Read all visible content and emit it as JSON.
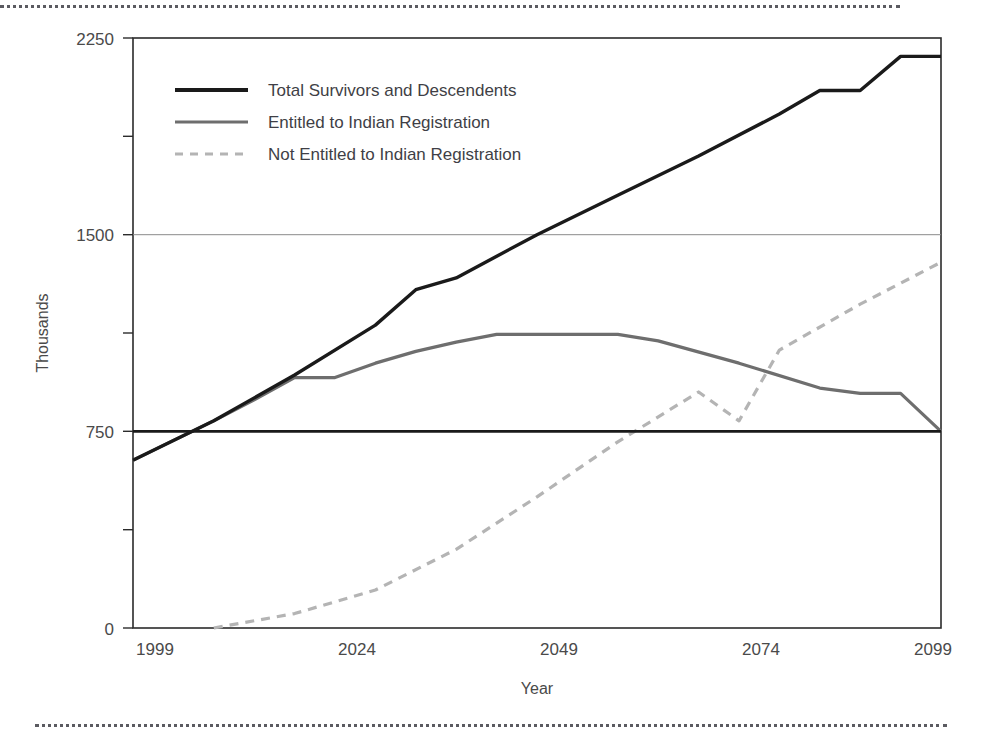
{
  "chart_data": {
    "type": "line",
    "title": "",
    "xlabel": "Year",
    "ylabel": "Thousands",
    "xlim": [
      1999,
      2099
    ],
    "ylim": [
      0,
      2250
    ],
    "xticks": [
      1999,
      2024,
      2049,
      2074,
      2099
    ],
    "xtick_labels": [
      "1999",
      "2024",
      "2049",
      "2074",
      "2099"
    ],
    "yticks": [
      0,
      375,
      750,
      1125,
      1500,
      1875,
      2250
    ],
    "ytick_labels": [
      "0",
      "",
      "750",
      "",
      "1500",
      "",
      "2250"
    ],
    "ytick_major": [
      0,
      750,
      1500,
      2250
    ],
    "ytick_minor": [
      375,
      1125,
      1875
    ],
    "grid": "horizontal-at-1500",
    "reference_line": {
      "label": "",
      "value": 750,
      "color": "#1a1a1a",
      "from": 1999,
      "to": 2099
    },
    "legend_position": "top-left-inside",
    "series": [
      {
        "name": "Total Survivors and Descendents",
        "style": "solid",
        "color": "#1a1a1a",
        "width": "thick",
        "x": [
          1999,
          2009,
          2019,
          2029,
          2034,
          2039,
          2049,
          2059,
          2069,
          2079,
          2084,
          2089,
          2094,
          2099
        ],
        "values": [
          640,
          790,
          965,
          1155,
          1290,
          1335,
          1500,
          1650,
          1800,
          1960,
          2050,
          2050,
          2180,
          2180
        ]
      },
      {
        "name": "Entitled to Indian Registration",
        "style": "solid",
        "color": "#6e6e6e",
        "width": "medium",
        "x": [
          1999,
          2009,
          2014,
          2019,
          2024,
          2029,
          2034,
          2039,
          2044,
          2049,
          2059,
          2064,
          2074,
          2084,
          2089,
          2094,
          2099
        ],
        "values": [
          640,
          790,
          870,
          955,
          955,
          1010,
          1055,
          1090,
          1120,
          1120,
          1120,
          1095,
          1010,
          915,
          895,
          895,
          750
        ]
      },
      {
        "name": "Not Entitled to Indian Registration",
        "style": "dashed",
        "color": "#b4b4b4",
        "width": "medium",
        "x": [
          2009,
          2019,
          2029,
          2039,
          2049,
          2059,
          2069,
          2074,
          2079,
          2089,
          2099
        ],
        "values": [
          0,
          55,
          145,
          300,
          500,
          710,
          900,
          790,
          1060,
          1235,
          1395
        ]
      }
    ]
  },
  "legend": {
    "items": [
      {
        "label": "Total Survivors and Descendents",
        "swatch": "solid-black-thick"
      },
      {
        "label": "Entitled to Indian Registration",
        "swatch": "solid-gray"
      },
      {
        "label": "Not Entitled to Indian Registration",
        "swatch": "dashed-lightgray"
      }
    ]
  },
  "axes": {
    "y_title": "Thousands",
    "x_title": "Year"
  },
  "colors": {
    "total": "#1a1a1a",
    "entitled": "#6e6e6e",
    "not_entitled": "#b4b4b4",
    "frame": "#2b2b2b",
    "grid": "#8a8a8a",
    "text": "#4a4a4a"
  }
}
